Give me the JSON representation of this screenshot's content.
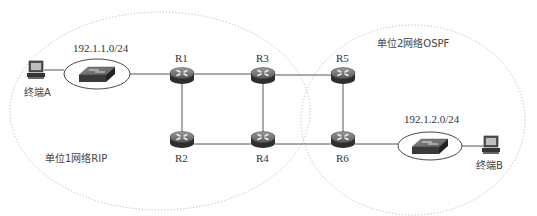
{
  "diagram": {
    "type": "network-topology",
    "regions": [
      {
        "id": "region1",
        "label": "单位1网络RIP",
        "cx": 160,
        "cy": 111,
        "rx": 150,
        "ry": 99
      },
      {
        "id": "region2",
        "label": "单位2网络OSPF",
        "cx": 413,
        "cy": 120,
        "rx": 112,
        "ry": 95
      }
    ],
    "routers": [
      {
        "id": "R1",
        "label": "R1",
        "x": 182,
        "y": 74,
        "label_pos": "top"
      },
      {
        "id": "R2",
        "label": "R2",
        "x": 182,
        "y": 138,
        "label_pos": "bottom"
      },
      {
        "id": "R3",
        "label": "R3",
        "x": 263,
        "y": 74,
        "label_pos": "top"
      },
      {
        "id": "R4",
        "label": "R4",
        "x": 263,
        "y": 138,
        "label_pos": "bottom"
      },
      {
        "id": "R5",
        "label": "R5",
        "x": 343,
        "y": 74,
        "label_pos": "top"
      },
      {
        "id": "R6",
        "label": "R6",
        "x": 343,
        "y": 138,
        "label_pos": "bottom"
      }
    ],
    "switches": [
      {
        "id": "SW1",
        "subnet": "192.1.1.0/24",
        "x": 96,
        "y": 74
      },
      {
        "id": "SW2",
        "subnet": "192.1.2.0/24",
        "x": 436,
        "y": 144
      }
    ],
    "terminals": [
      {
        "id": "A",
        "label": "终端A",
        "x": 36,
        "y": 72
      },
      {
        "id": "B",
        "label": "终端B",
        "x": 490,
        "y": 142
      }
    ],
    "links": [
      [
        "A",
        "SW1"
      ],
      [
        "SW1",
        "R1"
      ],
      [
        "R1",
        "R3"
      ],
      [
        "R1",
        "R2"
      ],
      [
        "R2",
        "R4"
      ],
      [
        "R3",
        "R4"
      ],
      [
        "R3",
        "R5"
      ],
      [
        "R4",
        "R6"
      ],
      [
        "R5",
        "R6"
      ],
      [
        "R6",
        "SW2"
      ],
      [
        "SW2",
        "B"
      ]
    ]
  },
  "labels": {
    "region1": "单位1网络RIP",
    "region2": "单位2网络OSPF",
    "subnet1": "192.1.1.0/24",
    "subnet2": "192.1.2.0/24",
    "terminalA": "终端A",
    "terminalB": "终端B",
    "R1": "R1",
    "R2": "R2",
    "R3": "R3",
    "R4": "R4",
    "R5": "R5",
    "R6": "R6"
  }
}
